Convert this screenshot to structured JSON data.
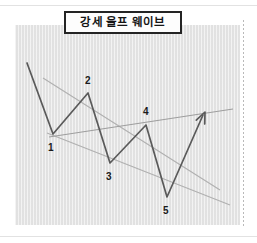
{
  "page": {
    "background_color": "#ffffff",
    "rules": [
      {
        "name": "top-rule",
        "color": "#e2e2e2"
      },
      {
        "name": "bottom-rule",
        "color": "#e2e2e2"
      }
    ],
    "right_dotted_divider_color": "#b9b9b9"
  },
  "title": {
    "label": "강세 울프 웨이브",
    "border_color": "#242424",
    "background_color": "#fdfdfd",
    "text_color": "#151515"
  },
  "chart": {
    "panel_background_color": "#e4e4e4",
    "price_line_color": "#5a5a5a",
    "trendline_color": "#b0b0b0",
    "arrow_color": "#5a5a5a"
  },
  "chart_data": {
    "type": "line",
    "title": "강세 울프 웨이브",
    "xlabel": "",
    "ylabel": "",
    "grid": false,
    "legend_position": "none",
    "axis_note": "unlabeled schematic price axes; coordinates are panel-relative, y increases downward",
    "xlim": [
      0,
      225
    ],
    "ylim": [
      200,
      0
    ],
    "series": [
      {
        "name": "price-path",
        "kind": "zigzag",
        "color": "#5a5a5a",
        "points": [
          {
            "label": "",
            "x": 12,
            "y": 38
          },
          {
            "label": "1",
            "x": 38,
            "y": 109
          },
          {
            "label": "2",
            "x": 73,
            "y": 68
          },
          {
            "label": "3",
            "x": 95,
            "y": 138
          },
          {
            "label": "4",
            "x": 131,
            "y": 100
          },
          {
            "label": "5",
            "x": 152,
            "y": 172
          },
          {
            "label": "",
            "x": 188,
            "y": 90
          }
        ]
      },
      {
        "name": "upper-trendline",
        "kind": "trendline",
        "color": "#b0b0b0",
        "description": "descending line through pivots 2 and 4",
        "points": [
          {
            "x": 28,
            "y": 53
          },
          {
            "x": 205,
            "y": 165
          }
        ]
      },
      {
        "name": "lower-trendline",
        "kind": "trendline",
        "color": "#b0b0b0",
        "description": "descending line through pivots 1, 3 and 5",
        "points": [
          {
            "x": 32,
            "y": 108
          },
          {
            "x": 215,
            "y": 180
          }
        ]
      },
      {
        "name": "target-line",
        "kind": "trendline",
        "color": "#9e9e9e",
        "description": "ascending 1-to-4 line extended to the projected target",
        "points": [
          {
            "x": 34,
            "y": 112
          },
          {
            "x": 218,
            "y": 84
          }
        ]
      }
    ],
    "arrow": {
      "name": "breakout-arrow",
      "color": "#5a5a5a",
      "from": {
        "x": 152,
        "y": 172
      },
      "to": {
        "x": 190,
        "y": 87
      },
      "direction": "up-right"
    },
    "pivot_labels": [
      {
        "label": "1",
        "x": 33,
        "y": 118
      },
      {
        "label": "2",
        "x": 70,
        "y": 51
      },
      {
        "label": "3",
        "x": 91,
        "y": 147
      },
      {
        "label": "4",
        "x": 128,
        "y": 82
      },
      {
        "label": "5",
        "x": 148,
        "y": 181
      }
    ]
  }
}
